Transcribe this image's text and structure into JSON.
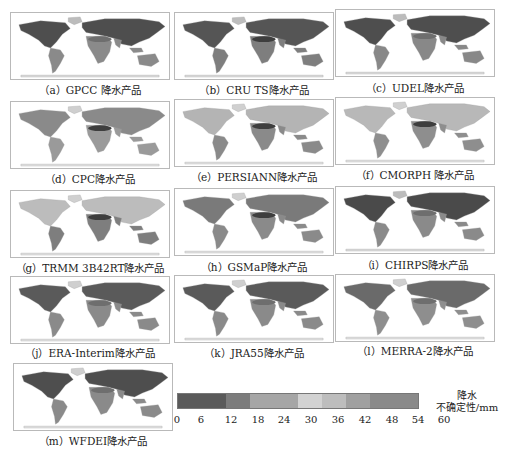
{
  "chart_data": {
    "type": "heatmap",
    "title": "",
    "panels": [
      {
        "id": "a",
        "caption": "（a）GPCC 降水产品",
        "product": "GPCC"
      },
      {
        "id": "b",
        "caption": "（b）CRU TS降水产品",
        "product": "CRU TS"
      },
      {
        "id": "c",
        "caption": "（c）UDEL降水产品",
        "product": "UDEL"
      },
      {
        "id": "d",
        "caption": "（d）CPC降水产品",
        "product": "CPC"
      },
      {
        "id": "e",
        "caption": "（e）PERSIANN降水产品",
        "product": "PERSIANN"
      },
      {
        "id": "f",
        "caption": "（f）CMORPH 降水产品",
        "product": "CMORPH"
      },
      {
        "id": "g",
        "caption": "（g）TRMM 3B42RT降水产品",
        "product": "TRMM 3B42RT"
      },
      {
        "id": "h",
        "caption": "（h）GSMaP降水产品",
        "product": "GSMaP"
      },
      {
        "id": "i",
        "caption": "（i）CHIRPS降水产品",
        "product": "CHIRPS"
      },
      {
        "id": "j",
        "caption": "（j）ERA-Interim降水产品",
        "product": "ERA-Interim"
      },
      {
        "id": "k",
        "caption": "（k）JRA55降水产品",
        "product": "JRA55"
      },
      {
        "id": "l",
        "caption": "（l）MERRA-2降水产品",
        "product": "MERRA-2"
      },
      {
        "id": "m",
        "caption": "（m）WFDEI降水产品",
        "product": "WFDEI"
      }
    ],
    "colorbar": {
      "title_line1": "降水",
      "title_line2": "不确定性/mm",
      "ticks": [
        "0",
        "6",
        "12",
        "18",
        "24",
        "30",
        "36",
        "42",
        "48",
        "54",
        "60"
      ],
      "range": [
        0,
        60
      ],
      "segments": [
        {
          "from": 0,
          "to": 12,
          "color": "#5a5a5a"
        },
        {
          "from": 12,
          "to": 18,
          "color": "#7c7c7c"
        },
        {
          "from": 18,
          "to": 30,
          "color": "#a6a6a6"
        },
        {
          "from": 30,
          "to": 36,
          "color": "#d2d2d2"
        },
        {
          "from": 36,
          "to": 42,
          "color": "#bdbdbd"
        },
        {
          "from": 42,
          "to": 48,
          "color": "#a0a0a0"
        },
        {
          "from": 48,
          "to": 60,
          "color": "#8a8a8a"
        }
      ]
    },
    "grid": false,
    "legend_position": "bottom-right"
  }
}
